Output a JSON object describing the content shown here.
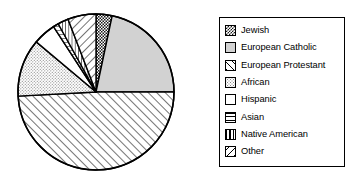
{
  "chart_data": {
    "type": "pie",
    "title": "",
    "subtitle": "",
    "xlabel": "",
    "ylabel": "",
    "grid": false,
    "legend_position": "right",
    "start_angle_deg": 0,
    "direction": "clockwise",
    "categories": [
      "Jewish",
      "European Catholic",
      "European Protestant",
      "African",
      "Hispanic",
      "Asian",
      "Native American",
      "Other"
    ],
    "values": [
      3.3,
      21.7,
      49.2,
      11.9,
      4.7,
      1.1,
      2.2,
      5.9
    ],
    "units": "percent",
    "slices": [
      {
        "label": "Jewish",
        "value": 3.3,
        "start_deg": 0.0,
        "end_deg": 12.0,
        "pattern": "dense-checker-dark",
        "fill": "#4a4a4a"
      },
      {
        "label": "European Catholic",
        "value": 21.7,
        "start_deg": 12.0,
        "end_deg": 90.0,
        "pattern": "solid-light-gray",
        "fill": "#d0d0d0"
      },
      {
        "label": "European Protestant",
        "value": 49.2,
        "start_deg": 90.0,
        "end_deg": 267.0,
        "pattern": "diagonal-up-right",
        "fill": "#ffffff"
      },
      {
        "label": "African",
        "value": 11.9,
        "start_deg": 267.0,
        "end_deg": 310.0,
        "pattern": "fine-stipple",
        "fill": "#e8e8e8"
      },
      {
        "label": "Hispanic",
        "value": 4.7,
        "start_deg": 310.0,
        "end_deg": 327.0,
        "pattern": "blank-white",
        "fill": "#ffffff"
      },
      {
        "label": "Asian",
        "value": 1.1,
        "start_deg": 327.0,
        "end_deg": 331.0,
        "pattern": "horizontal-lines",
        "fill": "#ffffff"
      },
      {
        "label": "Native American",
        "value": 2.2,
        "start_deg": 331.0,
        "end_deg": 339.0,
        "pattern": "vertical-lines",
        "fill": "#ffffff"
      },
      {
        "label": "Other",
        "value": 5.9,
        "start_deg": 339.0,
        "end_deg": 360.0,
        "pattern": "diagonal-down-right",
        "fill": "#ffffff"
      }
    ],
    "geometry": {
      "cx": 82,
      "cy": 82,
      "r": 78
    },
    "colors": {
      "outline": "#000000",
      "background": "#ffffff",
      "light_gray": "#d0d0d0",
      "dark_gray": "#4a4a4a",
      "stipple_gray": "#e8e8e8"
    }
  },
  "legend": {
    "items": [
      {
        "label": "Jewish",
        "swatch": "dense-checker-dark-swatch"
      },
      {
        "label": "European Catholic",
        "swatch": "solid-light-gray-swatch"
      },
      {
        "label": "European Protestant",
        "swatch": "diagonal-up-right-swatch"
      },
      {
        "label": "African",
        "swatch": "fine-stipple-swatch"
      },
      {
        "label": "Hispanic",
        "swatch": "blank-white-swatch"
      },
      {
        "label": "Asian",
        "swatch": "horizontal-lines-swatch"
      },
      {
        "label": "Native American",
        "swatch": "vertical-lines-swatch"
      },
      {
        "label": "Other",
        "swatch": "diagonal-down-right-swatch"
      }
    ]
  }
}
